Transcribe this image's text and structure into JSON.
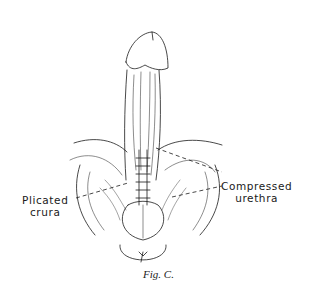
{
  "figure": {
    "caption": "Fig. C.",
    "labels": {
      "left": {
        "line1": "Plicated",
        "line2": "crura"
      },
      "right": {
        "line1": "Compressed",
        "line2": "urethra"
      }
    },
    "colors": {
      "ink": "#1a1a1a",
      "background": "#ffffff"
    }
  }
}
